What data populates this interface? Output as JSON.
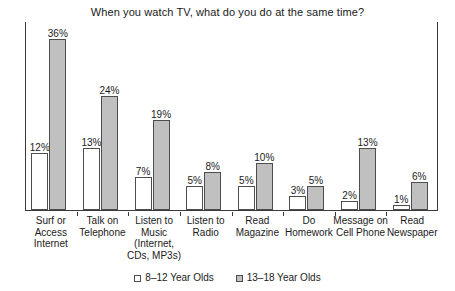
{
  "chart_data": {
    "type": "bar",
    "title": "When you watch TV, what do you do at the same time?",
    "xlabel": "",
    "ylabel": "",
    "ylim": [
      0,
      40
    ],
    "grid": false,
    "legend_position": "bottom",
    "categories": [
      "Surf or Access Internet",
      "Talk on Telephone",
      "Listen to Music (Internet, CDs, MP3s)",
      "Listen to Radio",
      "Read Magazine",
      "Do Homework",
      "Message on Cell Phone",
      "Read Newspaper"
    ],
    "category_lines": [
      [
        "Surf or",
        "Access",
        "Internet"
      ],
      [
        "Talk on",
        "Telephone"
      ],
      [
        "Listen to",
        "Music",
        "(Internet,",
        "CDs, MP3s)"
      ],
      [
        "Listen to",
        "Radio"
      ],
      [
        "Read",
        "Magazine"
      ],
      [
        "Do",
        "Homework"
      ],
      [
        "Message on",
        "Cell Phone"
      ],
      [
        "Read",
        "Newspaper"
      ]
    ],
    "series": [
      {
        "name": "8–12 Year Olds",
        "color": "#ffffff",
        "values": [
          12,
          13,
          7,
          5,
          5,
          3,
          2,
          1
        ],
        "labels": [
          "12%",
          "13%",
          "7%",
          "5%",
          "5%",
          "3%",
          "2%",
          "1%"
        ]
      },
      {
        "name": "13–18 Year Olds",
        "color": "#c0c0c0",
        "values": [
          36,
          24,
          19,
          8,
          10,
          5,
          13,
          6
        ],
        "labels": [
          "36%",
          "24%",
          "19%",
          "8%",
          "10%",
          "5%",
          "13%",
          "6%"
        ]
      }
    ]
  },
  "legend": {
    "items": [
      {
        "label": "8–12 Year Olds"
      },
      {
        "label": "13–18 Year Olds"
      }
    ]
  }
}
